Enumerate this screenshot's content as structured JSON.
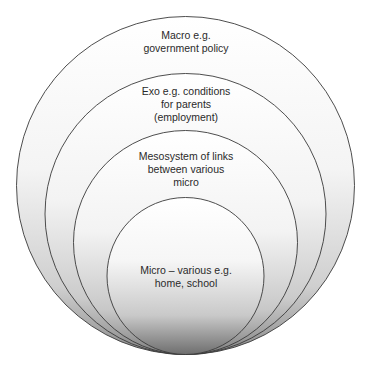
{
  "diagram": {
    "type": "nested-circles",
    "layers": [
      {
        "id": "macro",
        "lines": [
          "Macro e.g.",
          "government policy"
        ],
        "circle": {
          "cx": 185.5,
          "cy": 185.5,
          "r": 169
        }
      },
      {
        "id": "exo",
        "lines": [
          "Exo e.g. conditions",
          "for parents",
          "(employment)"
        ],
        "circle": {
          "cx": 185.5,
          "cy": 214,
          "r": 140.5
        }
      },
      {
        "id": "meso",
        "lines": [
          "Mesosystem of links",
          "between various",
          "micro"
        ],
        "circle": {
          "cx": 185.5,
          "cy": 242.5,
          "r": 112
        }
      },
      {
        "id": "micro",
        "lines": [
          "Micro – various e.g.",
          "home, school"
        ],
        "circle": {
          "cx": 185.5,
          "cy": 276,
          "r": 78.5
        }
      }
    ],
    "colors": {
      "stroke": "#3a3a3a",
      "fill_top": "#ffffff",
      "fill_bottom": "#8c8c8c",
      "text": "#2a2a2a",
      "background": "#ffffff"
    }
  }
}
